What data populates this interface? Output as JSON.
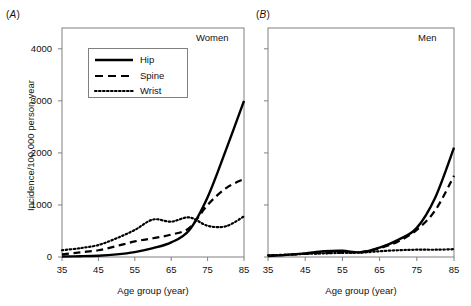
{
  "figure": {
    "panels": [
      {
        "tag": "A",
        "title": "Women"
      },
      {
        "tag": "B",
        "title": "Men"
      }
    ],
    "axis": {
      "ylabel": "Incidence/100,000 person-year",
      "xlabel": "Age group (year)",
      "yticks": [
        0,
        1000,
        2000,
        3000,
        4000
      ],
      "ytick_labels": [
        "0",
        "1000",
        "2000",
        "3000",
        "4000"
      ],
      "xticks": [
        35,
        45,
        55,
        65,
        75,
        85
      ],
      "xtick_labels": [
        "35",
        "45",
        "55",
        "65",
        "75",
        "85"
      ],
      "ylim": [
        0,
        4400
      ],
      "xlim": [
        35,
        85
      ]
    },
    "legend": {
      "position": "upper-left-panel-A",
      "entries": [
        {
          "label": "Hip",
          "style": "solid"
        },
        {
          "label": "Spine",
          "style": "dashed"
        },
        {
          "label": "Wrist",
          "style": "dotted"
        }
      ]
    },
    "colors": {
      "ink": "#000000",
      "frame": "#808080",
      "background": "#ffffff"
    }
  },
  "chart_data": [
    {
      "type": "line",
      "title": "Women",
      "panel": "A",
      "xlabel": "Age group (year)",
      "ylabel": "Incidence/100,000 person-year",
      "xlim": [
        35,
        85
      ],
      "ylim": [
        0,
        4400
      ],
      "grid": false,
      "x": [
        35,
        40,
        45,
        50,
        55,
        60,
        65,
        70,
        75,
        80,
        85
      ],
      "series": [
        {
          "name": "Hip",
          "style": "solid",
          "values": [
            10,
            15,
            25,
            50,
            95,
            170,
            280,
            520,
            1150,
            2050,
            3000
          ]
        },
        {
          "name": "Spine",
          "style": "dashed",
          "values": [
            50,
            90,
            130,
            210,
            300,
            360,
            430,
            560,
            1000,
            1320,
            1500
          ]
        },
        {
          "name": "Wrist",
          "style": "dotted",
          "values": [
            130,
            170,
            230,
            360,
            520,
            720,
            680,
            760,
            600,
            590,
            780
          ]
        }
      ]
    },
    {
      "type": "line",
      "title": "Men",
      "panel": "B",
      "xlabel": "Age group (year)",
      "ylabel": "Incidence/100,000 person-year",
      "xlim": [
        35,
        85
      ],
      "ylim": [
        0,
        4400
      ],
      "grid": false,
      "x": [
        35,
        40,
        45,
        50,
        55,
        60,
        65,
        70,
        75,
        80,
        85
      ],
      "series": [
        {
          "name": "Hip",
          "style": "solid",
          "values": [
            20,
            40,
            70,
            110,
            120,
            90,
            180,
            330,
            560,
            1150,
            2100
          ]
        },
        {
          "name": "Spine",
          "style": "dashed",
          "values": [
            25,
            40,
            60,
            75,
            85,
            95,
            170,
            300,
            520,
            900,
            1560
          ]
        },
        {
          "name": "Wrist",
          "style": "dotted",
          "values": [
            30,
            45,
            60,
            70,
            80,
            85,
            110,
            130,
            140,
            140,
            150
          ]
        }
      ]
    }
  ]
}
